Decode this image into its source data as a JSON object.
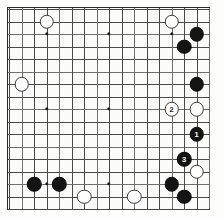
{
  "board": {
    "title": "Go board diagram",
    "size": 17,
    "grid_origin_x": 8,
    "grid_origin_y": 8,
    "grid_spacing": 12.5,
    "line_color": "#4a4a4a",
    "border_color": "#2b2b2b",
    "background_color": "#fbfbfa",
    "black_color": "#141414",
    "white_color": "#fefefe",
    "star_points": [
      {
        "col": 3,
        "row": 2
      },
      {
        "col": 8,
        "row": 2
      },
      {
        "col": 13,
        "row": 2
      },
      {
        "col": 3,
        "row": 8
      },
      {
        "col": 8,
        "row": 8
      },
      {
        "col": 13,
        "row": 8
      },
      {
        "col": 3,
        "row": 14
      },
      {
        "col": 8,
        "row": 14
      },
      {
        "col": 13,
        "row": 14
      }
    ],
    "stones": [
      {
        "color": "white",
        "col": 3,
        "row": 1,
        "label": ""
      },
      {
        "color": "white",
        "col": 13,
        "row": 1,
        "label": ""
      },
      {
        "color": "black",
        "col": 15,
        "row": 2,
        "label": ""
      },
      {
        "color": "black",
        "col": 14,
        "row": 3,
        "label": ""
      },
      {
        "color": "white",
        "col": 1,
        "row": 6,
        "label": ""
      },
      {
        "color": "black",
        "col": 15,
        "row": 6,
        "label": ""
      },
      {
        "color": "white",
        "col": 13,
        "row": 8,
        "label": "2"
      },
      {
        "color": "white",
        "col": 15,
        "row": 8,
        "label": ""
      },
      {
        "color": "black",
        "col": 15,
        "row": 10,
        "label": "1"
      },
      {
        "color": "black",
        "col": 14,
        "row": 12,
        "label": "3"
      },
      {
        "color": "white",
        "col": 15,
        "row": 13,
        "label": ""
      },
      {
        "color": "black",
        "col": 2,
        "row": 14,
        "label": ""
      },
      {
        "color": "black",
        "col": 4,
        "row": 14,
        "label": ""
      },
      {
        "color": "black",
        "col": 13,
        "row": 14,
        "label": ""
      },
      {
        "color": "black",
        "col": 14,
        "row": 15,
        "label": ""
      },
      {
        "color": "white",
        "col": 6,
        "row": 15,
        "label": ""
      },
      {
        "color": "white",
        "col": 10,
        "row": 15,
        "label": ""
      }
    ]
  }
}
